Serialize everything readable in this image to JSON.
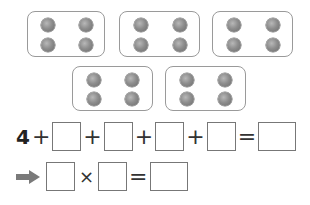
{
  "groups": [
    {
      "dots": 4
    },
    {
      "dots": 4
    },
    {
      "dots": 4
    },
    {
      "dots": 4
    },
    {
      "dots": 4
    }
  ],
  "addition_equation": {
    "first_term": "4",
    "plus": "+",
    "equals": "=",
    "blank_count": 4
  },
  "multiplication_equation": {
    "arrow_icon": "right-arrow-icon",
    "times": "×",
    "equals": "="
  },
  "colors": {
    "dot": "#8d8d8d",
    "border": "#9a9a9a",
    "arrow": "#7a7a7a"
  }
}
